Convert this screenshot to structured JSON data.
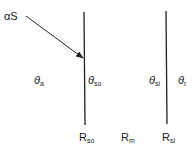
{
  "diagram": {
    "incident_label": "αS",
    "layers": {
      "outer_temp": {
        "symbol": "θ",
        "sub": "a"
      },
      "outer_surface_temp": {
        "symbol": "θ",
        "sub": "so"
      },
      "inner_surface_temp": {
        "symbol": "θ",
        "sub": "si"
      },
      "room_temp": {
        "symbol": "θ",
        "sub": "r"
      }
    },
    "resistances": {
      "outer": {
        "symbol": "R",
        "sub": "so"
      },
      "middle": {
        "symbol": "R",
        "sub": "m"
      },
      "inner": {
        "symbol": "R",
        "sub": "si"
      }
    },
    "colors": {
      "line": "#222222"
    }
  }
}
